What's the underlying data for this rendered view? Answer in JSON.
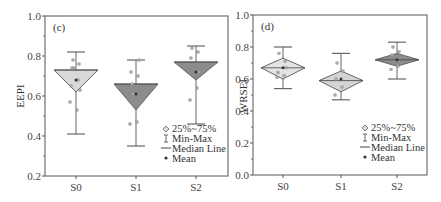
{
  "chart_data": [
    {
      "type": "box",
      "panel_label": "(c)",
      "ylabel": "EEPI",
      "xlabel": "",
      "ylim": [
        0.2,
        1.0
      ],
      "yticks": [
        "0.2",
        "0.4",
        "0.6",
        "0.8",
        "1.0"
      ],
      "categories": [
        "S0",
        "S1",
        "S2"
      ],
      "fill_colors": [
        "#d9d9d9",
        "#8c8c8c",
        "#8c8c8c"
      ],
      "boxes": [
        {
          "name": "S0",
          "min": 0.41,
          "q1": 0.62,
          "median": 0.73,
          "q3": 0.73,
          "max": 0.82,
          "mean": 0.68,
          "points": [
            0.57,
            0.53,
            0.65,
            0.68,
            0.74,
            0.76,
            0.78,
            0.63,
            0.74
          ]
        },
        {
          "name": "S1",
          "min": 0.35,
          "q1": 0.53,
          "median": 0.66,
          "q3": 0.66,
          "max": 0.78,
          "mean": 0.61,
          "points": [
            0.46,
            0.47,
            0.72,
            0.7,
            0.66,
            0.78,
            0.61
          ]
        },
        {
          "name": "S2",
          "min": 0.46,
          "q1": 0.68,
          "median": 0.77,
          "q3": 0.77,
          "max": 0.85,
          "mean": 0.72,
          "points": [
            0.58,
            0.64,
            0.79,
            0.82,
            0.84,
            0.72
          ]
        }
      ],
      "legend": [
        "25%~75%",
        "Min-Max",
        "Median Line",
        "Mean"
      ],
      "legend_position": "lower right"
    },
    {
      "type": "box",
      "panel_label": "(d)",
      "ylabel": "WRSEI",
      "xlabel": "",
      "ylim": [
        0.0,
        1.0
      ],
      "yticks": [
        "0.0",
        "0.2",
        "0.4",
        "0.6",
        "0.8",
        "1.0"
      ],
      "categories": [
        "S0",
        "S1",
        "S2"
      ],
      "fill_colors": [
        "#e3e3e3",
        "#d4d4d4",
        "#8c8c8c"
      ],
      "boxes": [
        {
          "name": "S0",
          "min": 0.54,
          "q1": 0.6,
          "median": 0.67,
          "q3": 0.73,
          "max": 0.8,
          "mean": 0.67,
          "points": [
            0.61,
            0.62,
            0.64,
            0.71,
            0.76,
            0.67
          ]
        },
        {
          "name": "S1",
          "min": 0.47,
          "q1": 0.52,
          "median": 0.59,
          "q3": 0.65,
          "max": 0.76,
          "mean": 0.6,
          "points": [
            0.5,
            0.55,
            0.6,
            0.65,
            0.7
          ]
        },
        {
          "name": "S2",
          "min": 0.6,
          "q1": 0.68,
          "median": 0.72,
          "q3": 0.76,
          "max": 0.83,
          "mean": 0.72,
          "points": [
            0.66,
            0.68,
            0.75,
            0.77,
            0.8
          ]
        }
      ],
      "legend": [
        "25%~75%",
        "Min-Max",
        "Median Line",
        "Mean"
      ],
      "legend_position": "lower right"
    }
  ]
}
